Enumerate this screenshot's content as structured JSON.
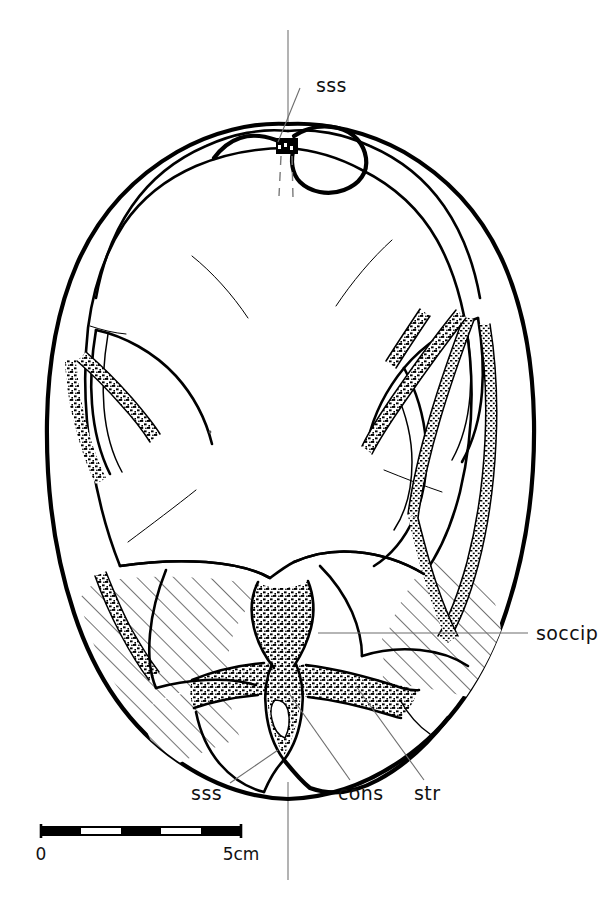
{
  "figure": {
    "kind": "anatomical-line-drawing",
    "background_color": "#ffffff",
    "ink_color": "#000000",
    "leader_color": "#6d6d6d"
  },
  "labels": {
    "sss_top": "sss",
    "sss_bottom": "sss",
    "cons": "cons",
    "str": "str",
    "soccip": "soccip"
  },
  "scale_bar": {
    "start_label": "0",
    "end_label": "5cm",
    "segments": 5,
    "segment_colors": [
      "#000000",
      "#ffffff",
      "#000000",
      "#ffffff",
      "#000000"
    ],
    "total_length_cm": 5,
    "unit": "cm"
  },
  "regions": {
    "hatched_name": "supraoccipital-hatching",
    "stippled_name": "venous-sinus-stipple",
    "hatch_angle_deg": 45,
    "hatch_spacing_px": 13
  }
}
